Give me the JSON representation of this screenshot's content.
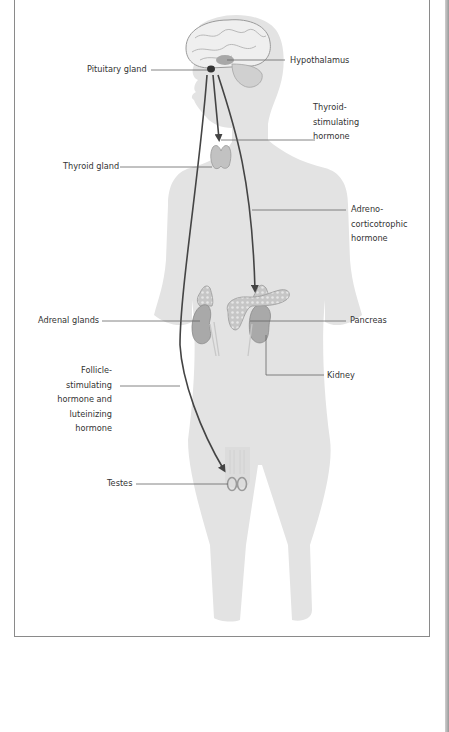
{
  "diagram": {
    "colors": {
      "body_fill": "#e3e3e3",
      "organ_fill": "#b9b9b9",
      "organ_stroke": "#8c8c8c",
      "arrow": "#444444",
      "leader_line": "#666666",
      "frame": "#8a8a8a"
    },
    "labels": {
      "pituitary": "Pituitary gland",
      "hypothalamus": "Hypothalamus",
      "tsh": "Thyroid-\nstimulating\nhormone",
      "thyroid": "Thyroid gland",
      "acth": "Adreno-\ncorticotrophic\nhormone",
      "adrenal": "Adrenal glands",
      "pancreas": "Pancreas",
      "fsh_lh": "Follicle-\nstimulating\nhormone and\nluteinizing\nhormone",
      "kidney": "Kidney",
      "testes": "Testes"
    },
    "pathways": [
      {
        "from": "Pituitary gland",
        "to": "Thyroid gland",
        "hormone": "Thyroid-stimulating hormone"
      },
      {
        "from": "Pituitary gland",
        "to": "Adrenal glands",
        "hormone": "Adreno-corticotrophic hormone"
      },
      {
        "from": "Pituitary gland",
        "to": "Testes",
        "hormone": "Follicle-stimulating hormone and luteinizing hormone"
      }
    ]
  }
}
